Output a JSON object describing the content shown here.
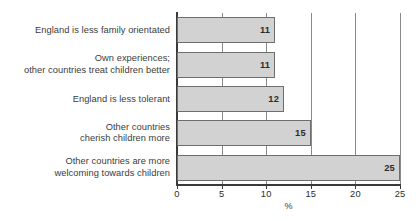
{
  "chart_data": {
    "type": "bar",
    "orientation": "horizontal",
    "title": "",
    "xlabel": "%",
    "ylabel": "",
    "xlim": [
      0,
      25
    ],
    "xticks": [
      0,
      5,
      10,
      15,
      20,
      25
    ],
    "xtick_labels": [
      "0",
      "5",
      "10",
      "15",
      "20",
      "25"
    ],
    "grid": true,
    "grid_axis": "x",
    "legend": false,
    "value_labels_inside_bars": true,
    "bar_fill_color": "#d2d2d2",
    "bar_edge_color": "#6e6e6e",
    "axis_color": "#3a3a3a",
    "gridline_color": "#8a8a8a",
    "text_color": "#3b3b3b",
    "categories": [
      "England is less family orientated",
      "Own experiences;\nother countries treat children better",
      "England is less tolerant",
      "Other countries\ncherish children more",
      "Other countries are more\nwelcoming towards children"
    ],
    "values": [
      11,
      11,
      12,
      15,
      25
    ],
    "value_text": [
      "11",
      "11",
      "12",
      "15",
      "25"
    ]
  }
}
